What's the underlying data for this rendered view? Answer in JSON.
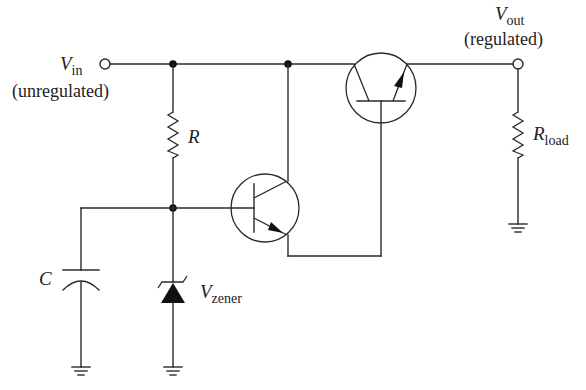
{
  "diagram": {
    "type": "zener-regulated darlington series voltage regulator schematic",
    "labels": {
      "vin": {
        "symbol": "V",
        "subscript": "in",
        "note": "(unregulated)"
      },
      "vout": {
        "symbol": "V",
        "subscript": "out",
        "note": "(regulated)"
      },
      "r": {
        "symbol": "R"
      },
      "rload": {
        "symbol": "R",
        "subscript": "load"
      },
      "c": {
        "symbol": "C"
      },
      "vzener": {
        "symbol": "V",
        "subscript": "zener"
      }
    },
    "components": [
      {
        "id": "vin-terminal",
        "kind": "terminal"
      },
      {
        "id": "vout-terminal",
        "kind": "terminal"
      },
      {
        "id": "R",
        "kind": "resistor"
      },
      {
        "id": "Rload",
        "kind": "resistor"
      },
      {
        "id": "C",
        "kind": "capacitor"
      },
      {
        "id": "Dz",
        "kind": "zener-diode"
      },
      {
        "id": "Q1",
        "kind": "npn-transistor",
        "role": "driver"
      },
      {
        "id": "Q2",
        "kind": "npn-transistor",
        "role": "pass"
      },
      {
        "id": "gnd-c",
        "kind": "ground"
      },
      {
        "id": "gnd-zener",
        "kind": "ground"
      },
      {
        "id": "gnd-load",
        "kind": "ground"
      }
    ],
    "colors": {
      "wire": "#2a2a2a",
      "background": "#ffffff"
    }
  }
}
